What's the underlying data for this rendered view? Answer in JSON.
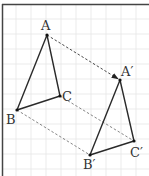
{
  "diagram": {
    "type": "translation",
    "grid": {
      "spacing": 15,
      "color": "#e6e6e6",
      "x_lines": [
        16,
        31,
        46,
        61,
        76,
        91,
        106,
        121,
        136
      ],
      "y_lines": [
        19,
        34,
        49,
        64,
        79,
        94,
        109,
        124,
        139,
        154,
        169
      ]
    },
    "frame": {
      "color": "#444444"
    },
    "triangle_original": {
      "name": "ABC",
      "vertices": {
        "A": {
          "x": 47,
          "y": 35,
          "label": "A"
        },
        "B": {
          "x": 17,
          "y": 110,
          "label": "B"
        },
        "C": {
          "x": 60,
          "y": 96,
          "label": "C"
        }
      }
    },
    "triangle_image": {
      "name": "A′B′C′",
      "vertices": {
        "A": {
          "x": 120,
          "y": 80,
          "label": "A′"
        },
        "B": {
          "x": 90,
          "y": 155,
          "label": "B′"
        },
        "C": {
          "x": 134,
          "y": 141,
          "label": "C′"
        }
      }
    },
    "translation_vector": {
      "from": "A",
      "to": "A′",
      "dx": 73,
      "dy": 45,
      "style": "dashed-arrow"
    },
    "connectors": [
      {
        "from": "B",
        "to": "B′",
        "style": "dashed"
      },
      {
        "from": "C",
        "to": "C′",
        "style": "dashed"
      }
    ],
    "line_color": "#333333",
    "dash_color": "#555555"
  }
}
